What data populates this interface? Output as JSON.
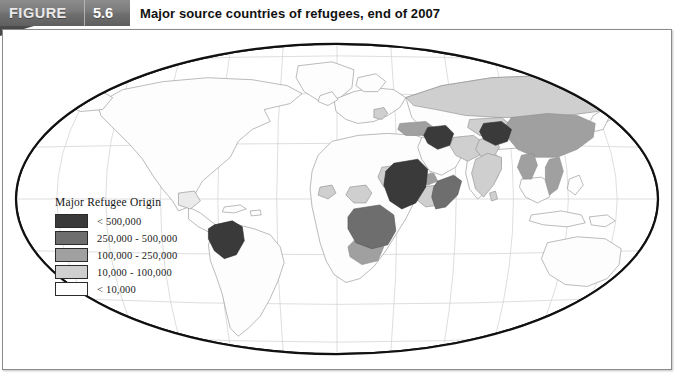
{
  "figure": {
    "tag_label": "FIGURE",
    "number": "5.6",
    "title": "Major source countries of refugees, end of 2007"
  },
  "legend": {
    "title": "Major Refugee Origin",
    "classes": [
      {
        "label": "< 500,000",
        "color": "#3a3a3a"
      },
      {
        "label": "250,000 - 500,000",
        "color": "#6e6e6e"
      },
      {
        "label": "100,000 - 250,000",
        "color": "#a0a0a0"
      },
      {
        "label": "10,000 - 100,000",
        "color": "#cfcfcf"
      },
      {
        "label": "< 10,000",
        "color": "#fdfdfd"
      }
    ]
  },
  "map": {
    "projection": "robinson-world",
    "graticule": true,
    "outline_color": "#111111",
    "graticule_color": "#c9c9c9",
    "country_border_color": "#8d8d8d",
    "ocean_color": "#ffffff",
    "highlighted_countries": [
      {
        "name": "Colombia",
        "class": "< 500,000"
      },
      {
        "name": "Iraq",
        "class": "< 500,000"
      },
      {
        "name": "Afghanistan",
        "class": "< 500,000"
      },
      {
        "name": "Sudan",
        "class": "< 500,000"
      },
      {
        "name": "Somalia",
        "class": "250,000 - 500,000"
      },
      {
        "name": "DR Congo",
        "class": "250,000 - 500,000"
      },
      {
        "name": "Angola",
        "class": "100,000 - 250,000"
      },
      {
        "name": "China",
        "class": "100,000 - 250,000"
      },
      {
        "name": "Vietnam",
        "class": "100,000 - 250,000"
      },
      {
        "name": "Turkey",
        "class": "100,000 - 250,000"
      },
      {
        "name": "Myanmar",
        "class": "100,000 - 250,000"
      },
      {
        "name": "Eritrea",
        "class": "100,000 - 250,000"
      },
      {
        "name": "Russia",
        "class": "10,000 - 100,000"
      },
      {
        "name": "Iran",
        "class": "10,000 - 100,000"
      },
      {
        "name": "Pakistan",
        "class": "10,000 - 100,000"
      },
      {
        "name": "India",
        "class": "10,000 - 100,000"
      },
      {
        "name": "Ethiopia",
        "class": "10,000 - 100,000"
      },
      {
        "name": "Chad",
        "class": "10,000 - 100,000"
      },
      {
        "name": "Nigeria",
        "class": "10,000 - 100,000"
      },
      {
        "name": "Liberia",
        "class": "10,000 - 100,000"
      },
      {
        "name": "Serbia",
        "class": "10,000 - 100,000"
      },
      {
        "name": "Sri Lanka",
        "class": "10,000 - 100,000"
      }
    ]
  }
}
